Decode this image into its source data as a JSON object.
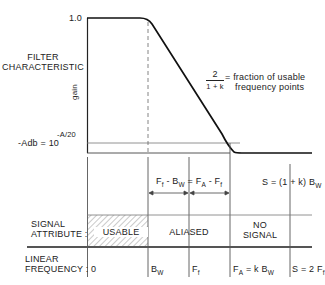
{
  "diagram": {
    "y_axis": {
      "top_tick": "1.0",
      "section_label_line1": "FILTER",
      "section_label_line2": "CHARACTERISTIC",
      "axis_label": "gain",
      "bottom_tick_prefix": "-Adb = 10",
      "bottom_tick_exponent": "-A/20"
    },
    "annotation": {
      "numerator": "2",
      "denominator": "1 + k",
      "text_line1": "= fraction of usable",
      "text_line2": "frequency points"
    },
    "intervals": {
      "left_a": "F",
      "left_a_sub": "f",
      "left_b": " - B",
      "left_b_sub": "W",
      "eq": " = F",
      "right_a_sub": "A",
      "right_b": " - F",
      "right_b_sub": "f",
      "s_label_prefix": "S = (1 + k) B",
      "s_label_sub": "W"
    },
    "signal_attribute": {
      "row_label_line1": "SIGNAL",
      "row_label_line2": "ATTRIBUTE :",
      "regions": [
        "USABLE",
        "ALIASED",
        "NO",
        "SIGNAL"
      ]
    },
    "linear_frequency": {
      "row_label_line1": "LINEAR",
      "row_label_line2": "FREQUENCY :",
      "ticks": [
        {
          "main": "0",
          "sub": ""
        },
        {
          "main": "B",
          "sub": "W"
        },
        {
          "main": "F",
          "sub": "f"
        },
        {
          "main": "F",
          "sub": "A",
          "suffix": " = k B",
          "suffix_sub": "W"
        },
        {
          "main": "S = 2 F",
          "sub": "f"
        }
      ]
    },
    "colors": {
      "ink": "#222222",
      "grid": "#777777",
      "rule": "#555555"
    }
  }
}
